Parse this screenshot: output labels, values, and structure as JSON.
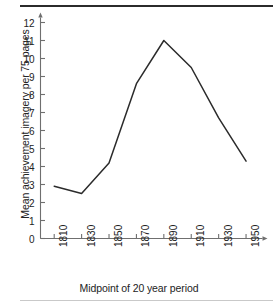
{
  "figure": {
    "background_color": "#ffffff",
    "line_color": "#2b2b2b",
    "axis_color": "#6f6f6f",
    "text_color": "#232323",
    "rule_top_color": "#2b2b2b",
    "rule_bottom_color": "#c9c9c9"
  },
  "chart_data": {
    "type": "line",
    "title": "",
    "subtitle": "",
    "xlabel": "Midpoint of 20 year period",
    "ylabel": "Mean achievement imagery per 75 pages",
    "categories": [
      "1810",
      "1830",
      "1850",
      "1870",
      "1890",
      "1910",
      "1930",
      "1950"
    ],
    "x": [
      1810,
      1830,
      1850,
      1870,
      1890,
      1910,
      1930,
      1950
    ],
    "values": [
      2.9,
      2.5,
      4.2,
      8.6,
      11.0,
      9.5,
      6.7,
      4.3
    ],
    "series": [
      {
        "name": "Mean achievement imagery per 75 pages",
        "values": [
          2.9,
          2.5,
          4.2,
          8.6,
          11.0,
          9.5,
          6.7,
          4.3
        ]
      }
    ],
    "xlim": [
      1800,
      1962
    ],
    "ylim": [
      0,
      12
    ],
    "ytick_labels": [
      "0",
      "1",
      "2",
      "3",
      "4",
      "5",
      "6",
      "7",
      "8",
      "9",
      "10",
      "11",
      "12"
    ],
    "ytick_values": [
      0,
      1,
      2,
      3,
      4,
      5,
      6,
      7,
      8,
      9,
      10,
      11,
      12
    ],
    "xtick_labels": [
      "1810",
      "1830",
      "1850",
      "1870",
      "1890",
      "1910",
      "1930",
      "1950"
    ],
    "grid": false,
    "legend": false,
    "legend_position": "none",
    "annotations": [],
    "marker": "none",
    "x_axis_arrow": true,
    "y_axis_arrow": true
  }
}
